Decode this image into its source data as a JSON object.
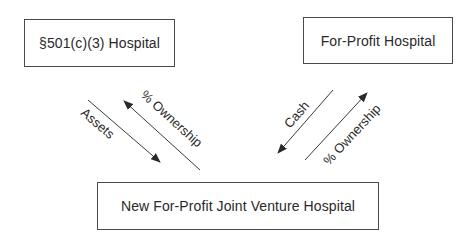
{
  "diagram": {
    "type": "flow",
    "nodes": [
      {
        "id": "nonprofit",
        "label": "§501(c)(3) Hospital"
      },
      {
        "id": "forprofit",
        "label": "For-Profit Hospital"
      },
      {
        "id": "jv",
        "label": "New For-Profit Joint Venture Hospital"
      }
    ],
    "edges": [
      {
        "from": "nonprofit",
        "to": "jv",
        "label": "Assets"
      },
      {
        "from": "jv",
        "to": "nonprofit",
        "label": "% Ownership"
      },
      {
        "from": "forprofit",
        "to": "jv",
        "label": "Cash"
      },
      {
        "from": "jv",
        "to": "forprofit",
        "label": "% Ownership"
      }
    ]
  },
  "colors": {
    "line": "#3a3a3a",
    "text": "#2a2a2a",
    "background": "#ffffff"
  }
}
